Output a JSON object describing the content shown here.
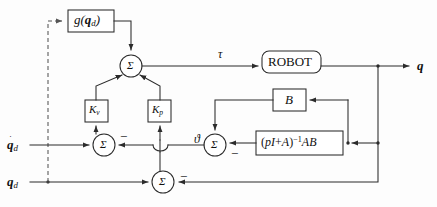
{
  "figure": {
    "kind": "control-block-diagram",
    "title_visible": false,
    "background_color": "#fdfdfd",
    "line_color": "#2b2b2b",
    "dashed_line_color": "#555555"
  },
  "blocks": {
    "gravity_compensation": {
      "label_main": "g",
      "label_arg_open": "(",
      "label_arg_var": "q",
      "label_arg_sub": "d",
      "label_arg_close": ")",
      "shape": "rect"
    },
    "robot": {
      "label": "ROBOT",
      "shape": "rounded-rect"
    },
    "gain_velocity": {
      "label_main": "K",
      "label_sub": "v",
      "shape": "rect"
    },
    "gain_position": {
      "label_main": "K",
      "label_sub": "p",
      "shape": "rect"
    },
    "actuator_matrix": {
      "label": "B",
      "shape": "rect"
    },
    "transfer_function": {
      "label_open": "(",
      "label_p": "p",
      "label_I": "I",
      "label_plus": "+",
      "label_A": "A",
      "label_close": ")",
      "label_exponent": "−1",
      "label_tail": "AB",
      "shape": "rect"
    }
  },
  "summing_junctions": [
    {
      "id": "sum-torque",
      "glyph": "Σ",
      "signs": []
    },
    {
      "id": "sum-velocity-error",
      "glyph": "Σ",
      "signs": [
        "−"
      ]
    },
    {
      "id": "sum-inner-loop",
      "glyph": "Σ",
      "signs": [
        "−"
      ]
    },
    {
      "id": "sum-position-error",
      "glyph": "Σ",
      "signs": [
        "−"
      ]
    }
  ],
  "signals": {
    "input_velocity": {
      "var": "q",
      "sub": "d",
      "has_dot": true,
      "description": "desired joint velocity"
    },
    "input_position": {
      "var": "q",
      "sub": "d",
      "has_dot": false,
      "description": "desired joint position"
    },
    "torque": {
      "symbol": "τ",
      "description": "control torque into robot"
    },
    "theta": {
      "symbol": "ϑ",
      "description": "intermediate variable into inner summing junction"
    },
    "output_position": {
      "var": "q",
      "has_dot": false,
      "description": "actual joint position output"
    }
  },
  "signs": {
    "minus": "−"
  }
}
